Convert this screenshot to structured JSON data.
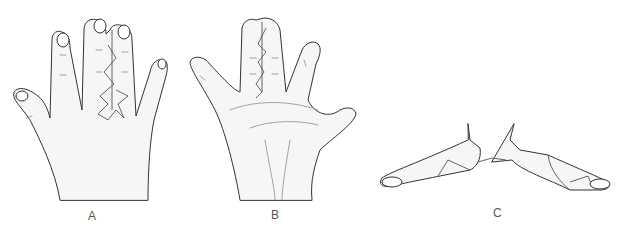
{
  "figure": {
    "panels": [
      {
        "id": "A",
        "label": "A",
        "description": "Dorsal view of hand with syndactyly of middle and ring fingers; zigzag incision with dorsal flap"
      },
      {
        "id": "B",
        "label": "B",
        "description": "Palmar view of hand with zigzag incision between joined fingers"
      },
      {
        "id": "C",
        "label": "C",
        "description": "Separated fingers with interdigitating flaps after release"
      }
    ]
  },
  "colors": {
    "outline": "#333333",
    "fill": "#f6f6f6",
    "label": "#555555"
  }
}
